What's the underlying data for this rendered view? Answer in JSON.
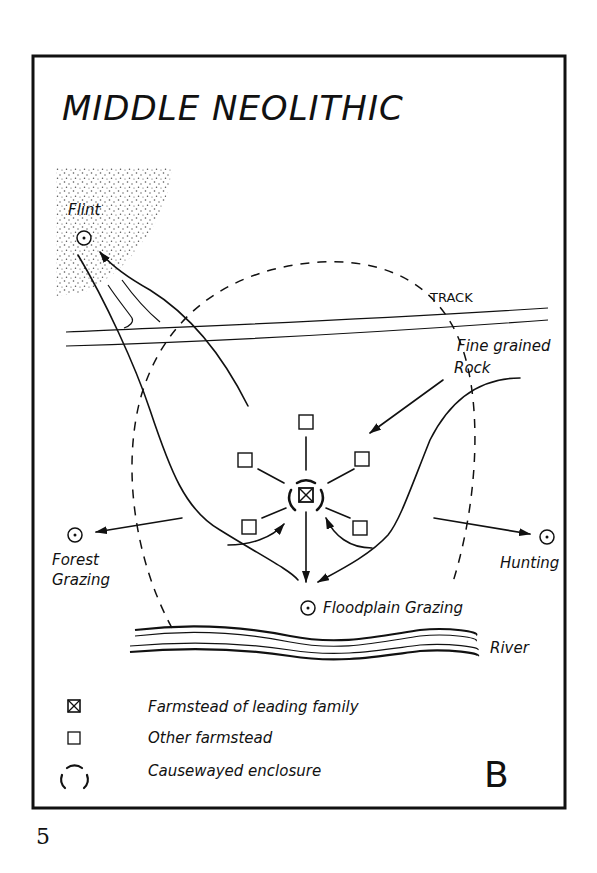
{
  "title": "MIDDLE NEOLITHIC",
  "panel_letter": "B",
  "page_number": "5",
  "labels": {
    "flint": "Flint",
    "track": "TRACK",
    "fine_grained_rock_line1": "Fine grained",
    "fine_grained_rock_line2": "Rock",
    "forest_grazing_line1": "Forest",
    "forest_grazing_line2": "Grazing",
    "hunting": "Hunting",
    "floodplain_grazing": "Floodplain Grazing",
    "river": "River"
  },
  "legend": {
    "items": [
      {
        "symbol": "crossed-square-icon",
        "label": "Farmstead of leading family"
      },
      {
        "symbol": "square-icon",
        "label": "Other farmstead"
      },
      {
        "symbol": "broken-circle-icon",
        "label": "Causewayed enclosure"
      }
    ]
  },
  "colors": {
    "ink": "#111111",
    "paper": "#ffffff",
    "stipple": "#555555"
  }
}
